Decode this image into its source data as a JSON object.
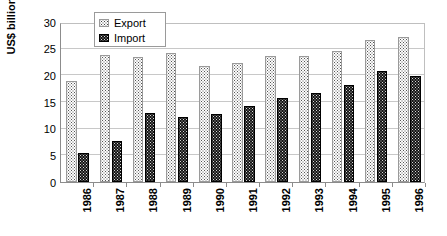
{
  "chart_data": {
    "type": "bar",
    "title": "",
    "xlabel": "",
    "ylabel": "US$ billion",
    "ylim": [
      0,
      30
    ],
    "ytick_step": 5,
    "yticks": [
      "0",
      "5",
      "10",
      "15",
      "20",
      "25",
      "30"
    ],
    "grid": true,
    "legend_position": "top-left-inside",
    "categories": [
      "1986",
      "1987",
      "1988",
      "1989",
      "1990",
      "1991",
      "1992",
      "1993",
      "1994",
      "1995",
      "1996"
    ],
    "series": [
      {
        "name": "Export",
        "values": [
          19.0,
          23.8,
          23.5,
          24.2,
          21.8,
          22.4,
          23.7,
          23.6,
          24.5,
          26.6,
          27.1
        ]
      },
      {
        "name": "Import",
        "values": [
          5.5,
          7.7,
          13.0,
          12.1,
          12.7,
          14.2,
          15.8,
          16.7,
          18.1,
          20.8,
          19.9
        ]
      }
    ],
    "colors": {
      "export_fill": "#fdfdfd",
      "export_border": "#9a9a9a",
      "import_fill": "#141414",
      "import_border": "#000000",
      "gridline": "#c8c8c8",
      "axis": "#8c8c8c",
      "text": "#000000"
    }
  },
  "legend": {
    "items": [
      {
        "label": "Export",
        "swatch": "export-swatch-icon"
      },
      {
        "label": "Import",
        "swatch": "import-swatch-icon"
      }
    ]
  }
}
